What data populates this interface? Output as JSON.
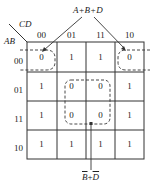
{
  "kmap": {
    "row_var": "AB",
    "col_var": "CD",
    "col_headers": [
      "00",
      "01",
      "11",
      "10"
    ],
    "row_headers": [
      "00",
      "01",
      "11",
      "10"
    ],
    "cells": [
      [
        "0",
        "1",
        "1",
        "0"
      ],
      [
        "1",
        "0",
        "0",
        "1"
      ],
      [
        "1",
        "0",
        "0",
        "1"
      ],
      [
        "1",
        "1",
        "1",
        "1"
      ]
    ]
  },
  "annotations": {
    "top_group_label": "A+B+D",
    "center_group_label_part1": "B",
    "center_group_label_op": "+",
    "center_group_label_part2": "D"
  },
  "colors": {
    "line": "#333333",
    "text": "#222222",
    "background": "#ffffff"
  }
}
